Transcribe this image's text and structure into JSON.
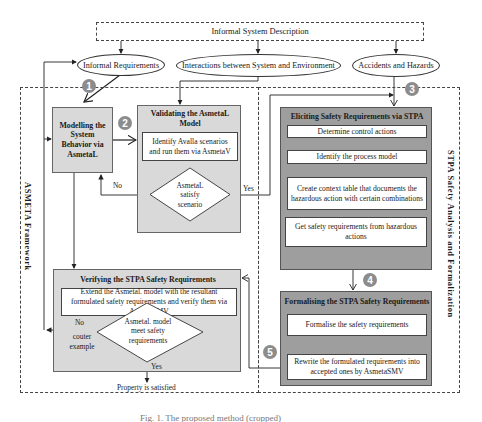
{
  "top": {
    "system_description": "Informal System Description"
  },
  "inputs": {
    "informal_requirements": "Informal Requirements",
    "interactions": "Interactions between System and Environment",
    "accidents_hazards": "Accidents and Hazards"
  },
  "frames": {
    "asmeta": "ASMETA Framework",
    "stpa": "STPA Safety Analysis and Formalization"
  },
  "badges": [
    "1",
    "2",
    "3",
    "4",
    "5"
  ],
  "modelling": {
    "title": "Modelling the System Behavior via AsmetaL"
  },
  "validating": {
    "title": "Validating the AsmetaL Model",
    "step": "Identify Avalla scenarios and run them via AsmetaV",
    "decision": "AsmetaL satisfy scenario",
    "no_label": "No",
    "yes_label": "Yes"
  },
  "eliciting": {
    "title": "Eliciting Safety Requirements via STPA",
    "steps": [
      "Determine control actions",
      "Identify the process model",
      "Create context table that documents the hazardous action with certain combinations",
      "Get safety requirements from hazardous actions"
    ]
  },
  "formalising": {
    "title": "Formalising the STPA Safety Requirements",
    "steps": [
      "Formalise the safety requirements",
      "Rewrite the formulated requirements into accepted ones by AsmetaSMV"
    ]
  },
  "verifying": {
    "title": "Verifying the STPA Safety Requirements",
    "step": "Extend the Asmetal. model with the resultant formulated safety requirements and verify them via AsmetaSMV",
    "decision": "Asmetal. model meet safety requirements",
    "no_label": "No",
    "counter_label": "couter example",
    "yes_label": "Yes",
    "result": "Property is satisfied"
  },
  "caption": {
    "text": "Fig. 1. The proposed method (cropped)"
  },
  "colors": {
    "gray_box": "#d9d9d9",
    "dark_box": "#9e9e9e",
    "badge": "#8c8c8c",
    "line": "#222222"
  }
}
